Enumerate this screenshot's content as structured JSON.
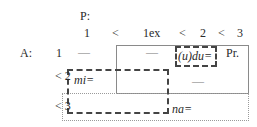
{
  "header": {
    "label": "P:",
    "order": [
      "1",
      "<",
      "1ex",
      "<",
      "2",
      "<",
      "3"
    ]
  },
  "rows": [
    {
      "row_label": "A:",
      "level": "1",
      "cells": [
        "—",
        "—",
        "(u)du=",
        "Pr."
      ]
    },
    {
      "level": "< 2",
      "cells": [
        "mi=",
        "—"
      ]
    },
    {
      "level": "< 3",
      "cells": [
        "na="
      ]
    }
  ],
  "colors": {
    "solid_border": "#8a8a8a",
    "dashed_border": "#444444",
    "dotted_border": "#9a9a9a",
    "text": "#2a2a2a"
  }
}
